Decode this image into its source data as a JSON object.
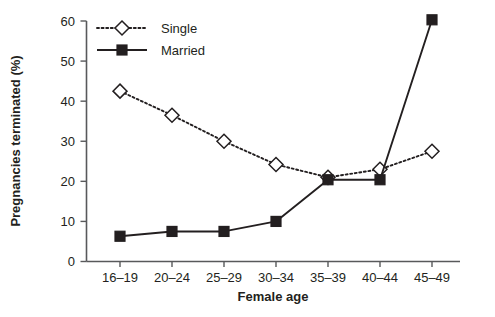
{
  "chart_data": {
    "type": "line",
    "title": "",
    "xlabel": "Female age",
    "ylabel": "Pregnancies terminated (%)",
    "categories": [
      "16–19",
      "20–24",
      "25–29",
      "30–34",
      "35–39",
      "40–44",
      "45–49"
    ],
    "series": [
      {
        "name": "Single",
        "marker": "open-diamond",
        "linestyle": "dotted",
        "color": "#231f20",
        "values": [
          42.5,
          36.5,
          30.0,
          24.2,
          21.0,
          23.0,
          27.5
        ]
      },
      {
        "name": "Married",
        "marker": "filled-square",
        "linestyle": "solid",
        "color": "#231f20",
        "values": [
          6.3,
          7.5,
          7.5,
          10.0,
          20.4,
          20.4,
          60.3
        ]
      }
    ],
    "ylim": [
      0,
      60
    ],
    "yticks": [
      0,
      10,
      20,
      30,
      40,
      50,
      60
    ],
    "ytick_labels": [
      "0",
      "10",
      "20",
      "30",
      "40",
      "50",
      "60"
    ],
    "grid": false,
    "legend_position": "top-left",
    "legend_entries": [
      "Single",
      "Married"
    ]
  },
  "colors": {
    "ink": "#231f20",
    "axis": "#58595b",
    "background": "#ffffff"
  }
}
